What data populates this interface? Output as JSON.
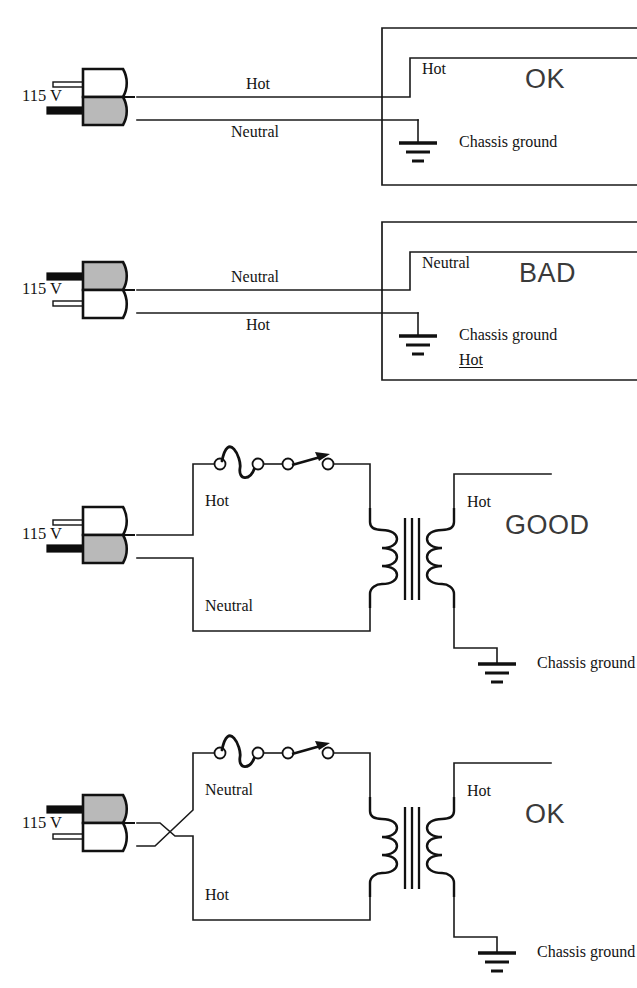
{
  "figure": {
    "kind": "electrical-wiring-safety-diagram",
    "panel_count": 4,
    "ink_color": "#1a1a1a",
    "plug_gray_color": "#b9b9b9",
    "verdict_color": "#3a3a3a"
  },
  "panels": [
    {
      "id": "panel-1",
      "verdict": "OK",
      "source_label": "115 V",
      "plug": {
        "orientation": "hot-top",
        "top_half_fill": "white",
        "bottom_half_fill": "gray",
        "top_prong": "hollow",
        "bottom_prong": "solid"
      },
      "wires": [
        {
          "name": "upper-wire",
          "label": "Hot",
          "label_position": "above"
        },
        {
          "name": "lower-wire",
          "label": "Neutral",
          "label_position": "below"
        }
      ],
      "chassis_labels": [
        {
          "name": "chassis-hot",
          "text": "Hot"
        },
        {
          "name": "chassis-ground",
          "text": "Chassis ground"
        }
      ],
      "has_transformer": false,
      "has_fuse": false,
      "has_switch": false
    },
    {
      "id": "panel-2",
      "verdict": "BAD",
      "source_label": "115 V",
      "plug": {
        "orientation": "hot-bottom",
        "top_half_fill": "gray",
        "bottom_half_fill": "white",
        "top_prong": "solid",
        "bottom_prong": "hollow"
      },
      "wires": [
        {
          "name": "upper-wire",
          "label": "Neutral",
          "label_position": "above"
        },
        {
          "name": "lower-wire",
          "label": "Hot",
          "label_position": "below"
        }
      ],
      "chassis_labels": [
        {
          "name": "chassis-neutral",
          "text": "Neutral"
        },
        {
          "name": "chassis-ground",
          "text": "Chassis ground"
        },
        {
          "name": "chassis-ground-hot-warning",
          "text": "Hot",
          "underlined": true
        }
      ],
      "has_transformer": false,
      "has_fuse": false,
      "has_switch": false
    },
    {
      "id": "panel-3",
      "verdict": "GOOD",
      "source_label": "115 V",
      "plug": {
        "orientation": "hot-top",
        "top_half_fill": "white",
        "bottom_half_fill": "gray",
        "top_prong": "hollow",
        "bottom_prong": "solid"
      },
      "wires": [
        {
          "name": "primary-upper-wire",
          "label": "Hot",
          "label_position": "below-bend"
        },
        {
          "name": "primary-lower-wire",
          "label": "Neutral",
          "label_position": "above-bend"
        }
      ],
      "secondary_labels": [
        {
          "name": "secondary-hot",
          "text": "Hot"
        },
        {
          "name": "chassis-ground",
          "text": "Chassis ground"
        }
      ],
      "has_transformer": true,
      "has_fuse": true,
      "has_switch": true,
      "transformer": {
        "primary_turns": 3,
        "secondary_turns": 3,
        "core_lines": 3
      },
      "wires_crossed": false
    },
    {
      "id": "panel-4",
      "verdict": "OK",
      "source_label": "115 V",
      "plug": {
        "orientation": "hot-bottom",
        "top_half_fill": "gray",
        "bottom_half_fill": "white",
        "top_prong": "solid",
        "bottom_prong": "hollow"
      },
      "wires": [
        {
          "name": "primary-upper-wire",
          "label": "Neutral",
          "label_position": "below-bend"
        },
        {
          "name": "primary-lower-wire",
          "label": "Hot",
          "label_position": "above-bend"
        }
      ],
      "secondary_labels": [
        {
          "name": "secondary-hot",
          "text": "Hot"
        },
        {
          "name": "chassis-ground",
          "text": "Chassis ground"
        }
      ],
      "has_transformer": true,
      "has_fuse": true,
      "has_switch": true,
      "transformer": {
        "primary_turns": 3,
        "secondary_turns": 3,
        "core_lines": 3
      },
      "wires_crossed": true
    }
  ],
  "text": {
    "volt_1": "115 V",
    "volt_2": "115 V",
    "volt_3": "115 V",
    "volt_4": "115 V",
    "p1_wire_top": "Hot",
    "p1_wire_bottom": "Neutral",
    "p1_chassis_top": "Hot",
    "p1_chassis_ground": "Chassis ground",
    "p1_verdict": "OK",
    "p2_wire_top": "Neutral",
    "p2_wire_bottom": "Hot",
    "p2_chassis_top": "Neutral",
    "p2_chassis_ground": "Chassis ground",
    "p2_chassis_hot": "Hot",
    "p2_verdict": "BAD",
    "p3_wire_top": "Hot",
    "p3_wire_bottom": "Neutral",
    "p3_secondary_hot": "Hot",
    "p3_chassis_ground": "Chassis ground",
    "p3_verdict": "GOOD",
    "p4_wire_top": "Neutral",
    "p4_wire_bottom": "Hot",
    "p4_secondary_hot": "Hot",
    "p4_chassis_ground": "Chassis ground",
    "p4_verdict": "OK"
  }
}
